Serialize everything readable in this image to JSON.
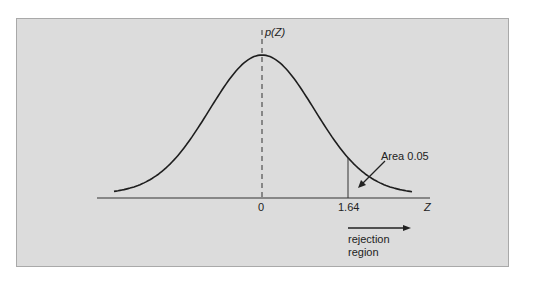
{
  "chart_data": {
    "type": "line",
    "title": "",
    "xlabel": "Z",
    "ylabel": "p(Z)",
    "x_ticks": [
      "0",
      "1.64"
    ],
    "xlim": [
      -3.2,
      3.2
    ],
    "grid": false,
    "series": [
      {
        "name": "Standard normal density p(Z)",
        "x": [
          -3.0,
          -2.5,
          -2.0,
          -1.5,
          -1.0,
          -0.5,
          0.0,
          0.5,
          1.0,
          1.5,
          2.0,
          2.5,
          3.0
        ],
        "values": [
          0.0044,
          0.0175,
          0.054,
          0.1295,
          0.242,
          0.3521,
          0.3989,
          0.3521,
          0.242,
          0.1295,
          0.054,
          0.0175,
          0.0044
        ]
      }
    ],
    "annotations": [
      {
        "text": "Area 0.05",
        "points_to": "right tail beyond Z = 1.64"
      },
      {
        "text": "rejection region",
        "arrow": "right",
        "from_x": 1.64
      },
      {
        "critical_value": 1.64,
        "line": "vertical solid"
      },
      {
        "mean_line": 0,
        "line": "vertical dashed"
      }
    ]
  },
  "labels": {
    "y_axis": "p(Z)",
    "x_axis": "Z",
    "tick_zero": "0",
    "tick_critical": "1.64",
    "area_note": "Area 0.05",
    "rejection_line1": "rejection",
    "rejection_line2": "region"
  },
  "colors": {
    "panel_bg": "#dcdcdc",
    "curve": "#1e1e1e",
    "text": "#222222"
  }
}
